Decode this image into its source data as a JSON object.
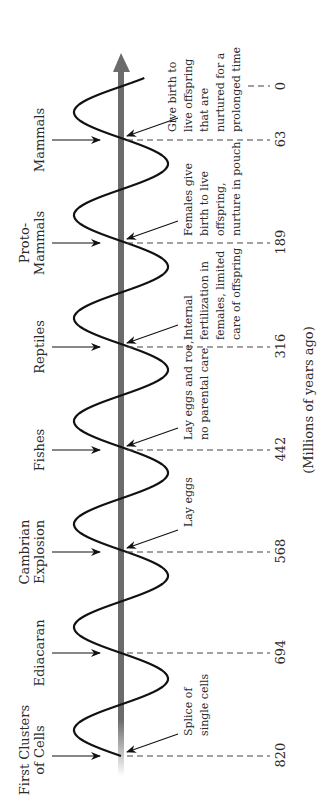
{
  "diagram": {
    "orientation": "rotated-90-ccw",
    "axis_title": "(Millions of years ago)",
    "colors": {
      "axis": "#6b6b6b",
      "wave": "#111111",
      "text": "#2a2a2a",
      "dash": "#444444"
    },
    "eras": [
      {
        "label_lines": [
          "First Clusters",
          "of Cells"
        ],
        "time": "820",
        "description_lines": [
          "Splice of",
          "single cells"
        ]
      },
      {
        "label_lines": [
          "Ediacaran"
        ],
        "time": "694",
        "description_lines": []
      },
      {
        "label_lines": [
          "Cambrian",
          "Explosion"
        ],
        "time": "568",
        "description_lines": [
          "Lay eggs"
        ]
      },
      {
        "label_lines": [
          "Fishes"
        ],
        "time": "442",
        "description_lines": [
          "Lay eggs and roe,",
          "no parental care"
        ]
      },
      {
        "label_lines": [
          "Reptiles"
        ],
        "time": "316",
        "description_lines": [
          "Internal",
          "fertilization in",
          "females, limited",
          "care of offspring"
        ]
      },
      {
        "label_lines": [
          "Proto-",
          "Mammals"
        ],
        "time": "189",
        "description_lines": [
          "Females give",
          "birth to live",
          "offspring,",
          "nurture in pouch"
        ]
      },
      {
        "label_lines": [
          "Mammals"
        ],
        "time": "63",
        "description_lines": [
          "Give birth to",
          "live offspring",
          "that are",
          "nurtured for a",
          "prolonged time"
        ]
      },
      {
        "label_lines": [],
        "time": "0",
        "description_lines": []
      }
    ]
  }
}
